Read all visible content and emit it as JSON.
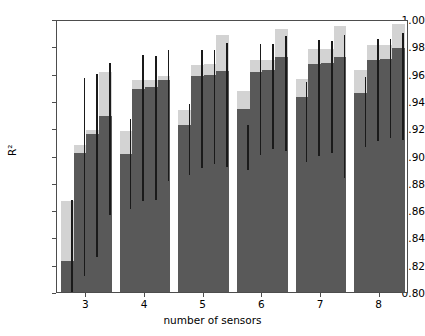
{
  "chart_data": {
    "type": "bar",
    "title": "",
    "xlabel": "number of sensors",
    "ylabel": "R²",
    "xlim": [
      2.5,
      8.5
    ],
    "ylim": [
      0.8,
      1.0
    ],
    "grid": false,
    "legend": null,
    "categories": [
      "3",
      "4",
      "5",
      "6",
      "7",
      "8"
    ],
    "xticks": [
      "3",
      "4",
      "5",
      "6",
      "7",
      "8"
    ],
    "yticks": [
      "0.80",
      "0.82",
      "0.84",
      "0.86",
      "0.88",
      "0.90",
      "0.92",
      "0.94",
      "0.96",
      "0.98",
      "1.00"
    ],
    "ytick_values": [
      0.8,
      0.82,
      0.84,
      0.86,
      0.88,
      0.9,
      0.92,
      0.94,
      0.96,
      0.98,
      1.0
    ],
    "bars_per_group": 4,
    "colors": {
      "bar_dark": "#595959",
      "bar_light": "#d3d3d3",
      "error_bar": "#1a1a1a",
      "axis": "#4d4d4d",
      "background": "#ffffff"
    },
    "series": [
      {
        "name": "dark bar (median)",
        "color": "#595959",
        "values": [
          [
            0.823,
            0.902,
            0.916,
            0.929
          ],
          [
            0.901,
            0.949,
            0.95,
            0.955
          ],
          [
            0.922,
            0.958,
            0.959,
            0.962
          ],
          [
            0.934,
            0.961,
            0.963,
            0.972
          ],
          [
            0.943,
            0.967,
            0.968,
            0.972
          ],
          [
            0.946,
            0.97,
            0.971,
            0.979
          ]
        ]
      },
      {
        "name": "light bar (upper)",
        "color": "#d3d3d3",
        "values": [
          [
            0.867,
            0.908,
            0.919,
            0.961
          ],
          [
            0.918,
            0.955,
            0.955,
            0.958
          ],
          [
            0.933,
            0.966,
            0.967,
            0.988
          ],
          [
            0.947,
            0.97,
            0.97,
            0.993
          ],
          [
            0.956,
            0.978,
            0.978,
            0.995
          ],
          [
            0.963,
            0.981,
            0.981,
            0.996
          ]
        ]
      }
    ],
    "error_bars": [
      [
        {
          "low": 0.8,
          "high": 0.869
        },
        {
          "low": 0.813,
          "high": 0.958
        },
        {
          "low": 0.827,
          "high": 0.961
        },
        {
          "low": 0.858,
          "high": 0.969
        }
      ],
      [
        {
          "low": 0.862,
          "high": 0.928
        },
        {
          "low": 0.868,
          "high": 0.975
        },
        {
          "low": 0.869,
          "high": 0.974
        },
        {
          "low": 0.883,
          "high": 0.979
        }
      ],
      [
        {
          "low": 0.887,
          "high": 0.939
        },
        {
          "low": 0.892,
          "high": 0.979
        },
        {
          "low": 0.895,
          "high": 0.979
        },
        {
          "low": 0.893,
          "high": 0.984
        }
      ],
      [
        {
          "low": 0.891,
          "high": 0.924
        },
        {
          "low": 0.902,
          "high": 0.983
        },
        {
          "low": 0.906,
          "high": 0.983
        },
        {
          "low": 0.905,
          "high": 0.989
        }
      ],
      [
        {
          "low": 0.897,
          "high": 0.955
        },
        {
          "low": 0.901,
          "high": 0.986
        },
        {
          "low": 0.903,
          "high": 0.985
        },
        {
          "low": 0.885,
          "high": 0.99
        }
      ],
      [
        {
          "low": 0.908,
          "high": 0.959
        },
        {
          "low": 0.912,
          "high": 0.987
        },
        {
          "low": 0.914,
          "high": 0.987
        },
        {
          "low": 0.913,
          "high": 0.991
        }
      ]
    ]
  }
}
